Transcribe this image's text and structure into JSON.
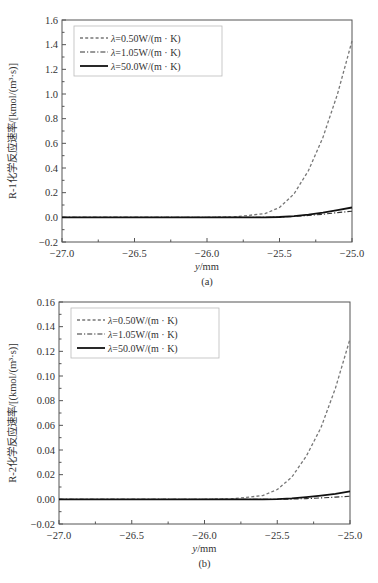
{
  "chart_data": [
    {
      "type": "line",
      "panel": "(a)",
      "title": "",
      "xlabel": "y/mm",
      "ylabel": "R-1化学反应速率/[kmol/(m³·s)]",
      "xlim": [
        -27.0,
        -25.0
      ],
      "ylim": [
        -0.2,
        1.6
      ],
      "xticks": [
        "-27.0",
        "-26.5",
        "-26.0",
        "-25.5",
        "-25.0"
      ],
      "yticks": [
        "-0.2",
        "0.0",
        "0.2",
        "0.4",
        "0.6",
        "0.8",
        "1.0",
        "1.2",
        "1.4",
        "1.6"
      ],
      "grid": false,
      "legend_position": "upper left",
      "x": [
        -27.0,
        -26.5,
        -26.0,
        -25.8,
        -25.6,
        -25.5,
        -25.4,
        -25.3,
        -25.2,
        -25.1,
        -25.0
      ],
      "series": [
        {
          "name": "λ=0.50W/(m·K)",
          "style": "dashed",
          "color": "#777777",
          "values": [
            0.0,
            0.0,
            0.0,
            0.005,
            0.03,
            0.08,
            0.19,
            0.38,
            0.65,
            1.0,
            1.43
          ]
        },
        {
          "name": "λ=1.05W/(m·K)",
          "style": "dash-dot",
          "color": "#333333",
          "values": [
            0.0,
            0.0,
            0.0,
            0.0,
            0.0,
            0.002,
            0.007,
            0.015,
            0.025,
            0.038,
            0.05
          ]
        },
        {
          "name": "λ=50.0W/(m·K)",
          "style": "solid",
          "color": "#111111",
          "values": [
            0.0,
            0.0,
            0.0,
            0.0,
            0.0,
            0.003,
            0.01,
            0.022,
            0.038,
            0.058,
            0.08
          ]
        }
      ]
    },
    {
      "type": "line",
      "panel": "(b)",
      "title": "",
      "xlabel": "y/mm",
      "ylabel": "R-2化学反应速率/[(kmol/(m³·s)]",
      "xlim": [
        -27.0,
        -25.0
      ],
      "ylim": [
        -0.02,
        0.16
      ],
      "xticks": [
        "-27.0",
        "-26.5",
        "-26.0",
        "-25.5",
        "-25.0"
      ],
      "yticks": [
        "-0.02",
        "0.00",
        "0.02",
        "0.04",
        "0.06",
        "0.08",
        "0.10",
        "0.12",
        "0.14",
        "0.16"
      ],
      "grid": false,
      "legend_position": "upper left",
      "x": [
        -27.0,
        -26.5,
        -26.0,
        -25.8,
        -25.6,
        -25.5,
        -25.4,
        -25.3,
        -25.2,
        -25.1,
        -25.0
      ],
      "series": [
        {
          "name": "λ=0.50W/(m·K)",
          "style": "dashed",
          "color": "#777777",
          "values": [
            0.0,
            0.0,
            0.0,
            0.0005,
            0.003,
            0.008,
            0.018,
            0.035,
            0.058,
            0.09,
            0.13
          ]
        },
        {
          "name": "λ=1.05W/(m·K)",
          "style": "dash-dot",
          "color": "#333333",
          "values": [
            0.0,
            0.0,
            0.0,
            0.0,
            0.0,
            0.0,
            0.0002,
            0.0006,
            0.0012,
            0.0018,
            0.0025
          ]
        },
        {
          "name": "λ=50.0W/(m·K)",
          "style": "solid",
          "color": "#111111",
          "values": [
            0.0,
            0.0,
            0.0,
            0.0,
            0.0,
            0.0002,
            0.0008,
            0.0018,
            0.003,
            0.0045,
            0.0065
          ]
        }
      ]
    }
  ],
  "panels": {
    "a": {
      "caption": "(a)",
      "xlabel": "y/mm",
      "ylabel": "R-1化学反应速率/[kmol/(m³·s)]",
      "legend": [
        "λ=0.50W/(m · K)",
        "λ=1.05W/(m · K)",
        "λ=50.0W/(m · K)"
      ]
    },
    "b": {
      "caption": "(b)",
      "xlabel": "y/mm",
      "ylabel": "R-2化学反应速率/[(kmol/(m³·s)]",
      "legend": [
        "λ=0.50W/(m · K)",
        "λ=1.05W/(m · K)",
        "λ=50.0W/(m · K)"
      ]
    }
  }
}
